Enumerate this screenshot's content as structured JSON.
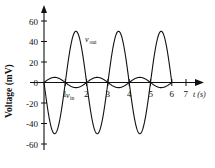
{
  "chart_data": {
    "type": "line",
    "title": "",
    "xlabel": "t (s)",
    "ylabel": "Voltage (mV)",
    "xlim": [
      -0.35,
      7.6
    ],
    "ylim": [
      -65,
      68
    ],
    "grid": false,
    "legend": "inline-labels",
    "x_ticks": [
      1,
      2,
      3,
      4,
      5,
      6,
      7
    ],
    "x_tick_labels": [
      "1",
      "2",
      "3",
      "4",
      "5",
      "6",
      "7"
    ],
    "y_ticks": [
      60,
      40,
      20,
      0,
      -20,
      -40,
      -60
    ],
    "y_tick_labels": [
      "60",
      "40",
      "20",
      "0",
      "-20",
      "-40",
      "-60"
    ],
    "axis_arrows": {
      "x_right": true,
      "y_top": true
    },
    "series": [
      {
        "name": "v_out",
        "label_text": "v",
        "label_sub": "out",
        "amplitude": 50,
        "period": 2,
        "phase_deg": 180,
        "t_start": 0,
        "t_end": 6,
        "description": "Large inverted sine, amplitude 50 mV, period 2 s, starts at 0 and dips negative first",
        "key_points": [
          {
            "t": 0.0,
            "v": 0
          },
          {
            "t": 0.5,
            "v": -50
          },
          {
            "t": 1.0,
            "v": 0
          },
          {
            "t": 1.5,
            "v": 50
          },
          {
            "t": 2.0,
            "v": 0
          },
          {
            "t": 2.5,
            "v": -50
          },
          {
            "t": 3.0,
            "v": 0
          },
          {
            "t": 3.5,
            "v": 50
          },
          {
            "t": 4.0,
            "v": 0
          },
          {
            "t": 4.5,
            "v": -50
          },
          {
            "t": 5.0,
            "v": 0
          },
          {
            "t": 5.5,
            "v": 50
          },
          {
            "t": 6.0,
            "v": 0
          }
        ]
      },
      {
        "name": "v_in",
        "label_text": "v",
        "label_sub": "in",
        "amplitude": 5,
        "period": 2,
        "phase_deg": 0,
        "t_start": 0,
        "t_end": 6,
        "description": "Small sine, amplitude 5 mV, period 2 s, starts at 0 and rises positive first",
        "key_points": [
          {
            "t": 0.0,
            "v": 0
          },
          {
            "t": 0.5,
            "v": 5
          },
          {
            "t": 1.0,
            "v": 0
          },
          {
            "t": 1.5,
            "v": -5
          },
          {
            "t": 2.0,
            "v": 0
          },
          {
            "t": 2.5,
            "v": 5
          },
          {
            "t": 3.0,
            "v": 0
          },
          {
            "t": 3.5,
            "v": -5
          },
          {
            "t": 4.0,
            "v": 0
          },
          {
            "t": 4.5,
            "v": 5
          },
          {
            "t": 5.0,
            "v": 0
          },
          {
            "t": 5.5,
            "v": -5
          },
          {
            "t": 6.0,
            "v": 0
          }
        ]
      }
    ],
    "annotations": [
      {
        "name": "v-out-label",
        "t": 1.95,
        "v": 44,
        "text": "v",
        "sub": "out"
      },
      {
        "name": "v-in-label",
        "t": 0.72,
        "v": -11,
        "text": "v",
        "sub": "in"
      }
    ]
  }
}
